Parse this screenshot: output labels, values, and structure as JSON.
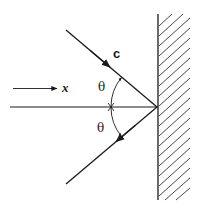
{
  "figure": {
    "labels": {
      "velocity": "c",
      "direction": "x",
      "angle_top": "θ",
      "angle_bottom": "θ"
    },
    "colors": {
      "stroke": "#1a1a1a",
      "background": "#ffffff"
    },
    "elements": [
      "incident ray with arrow (c)",
      "reflected ray with arrow",
      "horizontal normal/axis line",
      "direction arrow labeled x",
      "angle arcs θ above and below axis",
      "hatched reflecting wall"
    ]
  }
}
